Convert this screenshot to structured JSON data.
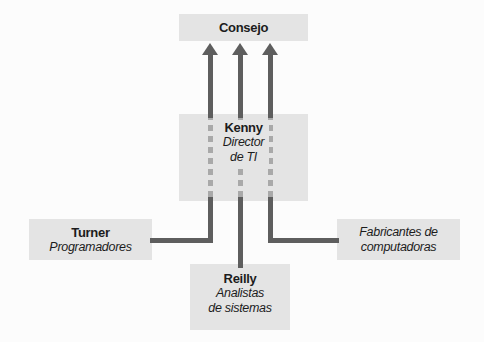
{
  "colors": {
    "background": "#fcfcfc",
    "box-fill": "#e4e4e4",
    "line": "#5e5e5e",
    "dash": "#a9a9a9",
    "text": "#1c1c1c"
  },
  "nodes": {
    "consejo": {
      "name": "Consejo"
    },
    "kenny": {
      "name": "Kenny",
      "role": [
        "Director",
        "de TI"
      ]
    },
    "turner": {
      "name": "Turner",
      "role": [
        "Programadores"
      ]
    },
    "reilly": {
      "name": "Reilly",
      "role": [
        "Analistas",
        "de sistemas"
      ]
    },
    "fabricantes": {
      "role": [
        "Fabricantes de",
        "computadoras"
      ]
    }
  },
  "edges": [
    {
      "from": "Turner",
      "to": "Consejo",
      "style": "solid elbow, dashed through Kenny box, arrow up"
    },
    {
      "from": "Reilly",
      "to": "Consejo",
      "style": "solid vertical, dashed through Kenny box, arrow up"
    },
    {
      "from": "Fabricantes de computadoras",
      "to": "Consejo",
      "style": "solid elbow, dashed through Kenny box, arrow up"
    }
  ]
}
